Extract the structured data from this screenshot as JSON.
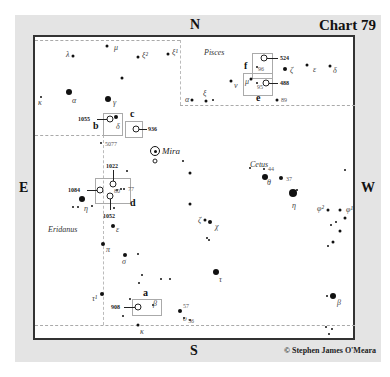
{
  "chart": {
    "title": "Chart 79",
    "credit": "© Stephen James O'Meara",
    "compass": {
      "north": "N",
      "south": "S",
      "east": "E",
      "west": "W"
    }
  },
  "constellations": [
    {
      "name": "Pisces",
      "x": 204,
      "y": 48
    },
    {
      "name": "Cetus",
      "x": 250,
      "y": 160
    },
    {
      "name": "Eridanus",
      "x": 48,
      "y": 225
    }
  ],
  "boxes": [
    {
      "id": "a",
      "label": "a",
      "box": {
        "x": 132,
        "y": 299,
        "w": 28,
        "h": 15
      },
      "label_pos": {
        "x": 143,
        "y": 287
      }
    },
    {
      "id": "b",
      "label": "b",
      "box": {
        "x": 103,
        "y": 113,
        "w": 18,
        "h": 21
      },
      "label_pos": {
        "x": 93,
        "y": 120
      }
    },
    {
      "id": "c",
      "label": "c",
      "box": {
        "x": 125,
        "y": 121,
        "w": 16,
        "h": 15
      },
      "label_pos": {
        "x": 130,
        "y": 108
      }
    },
    {
      "id": "d",
      "label": "d",
      "box": {
        "x": 95,
        "y": 178,
        "w": 34,
        "h": 24
      },
      "label_pos": {
        "x": 130,
        "y": 197
      }
    },
    {
      "id": "e",
      "label": "e",
      "box": {
        "x": 243,
        "y": 73,
        "w": 28,
        "h": 21
      },
      "label_pos": {
        "x": 256,
        "y": 92
      }
    },
    {
      "id": "f",
      "label": "f",
      "box": {
        "x": 252,
        "y": 53,
        "w": 19,
        "h": 24
      },
      "label_pos": {
        "x": 244,
        "y": 60
      }
    }
  ],
  "galaxies": [
    {
      "ngc": "908",
      "x": 138,
      "y": 307,
      "label_x": 111,
      "leader": {
        "x": 124,
        "w": 11
      }
    },
    {
      "ngc": "1055",
      "x": 110,
      "y": 119,
      "label_x": 78,
      "leader": {
        "x": 97,
        "w": 10
      }
    },
    {
      "ngc": "936",
      "x": 136,
      "y": 129,
      "label_x": 148,
      "leader": {
        "x": 139,
        "w": 8
      }
    },
    {
      "ngc": "1022",
      "x": 113,
      "y": 184,
      "label_x": 106,
      "label_y": 166,
      "vleader": {
        "y": 170,
        "h": 11
      }
    },
    {
      "ngc": "1084",
      "x": 100,
      "y": 190,
      "label_x": 68,
      "leader": {
        "x": 87,
        "w": 10
      }
    },
    {
      "ngc": "1052",
      "x": 110,
      "y": 196,
      "label_x": 103,
      "label_y": 216,
      "vleader": {
        "y": 199,
        "h": 11
      }
    },
    {
      "ngc": "524",
      "x": 264,
      "y": 58,
      "label_x": 280,
      "leader": {
        "x": 267,
        "w": 11
      }
    },
    {
      "ngc": "488",
      "x": 266,
      "y": 83,
      "label_x": 280,
      "leader": {
        "x": 269,
        "w": 9
      }
    }
  ],
  "mira": {
    "name": "Mira",
    "x": 155,
    "y": 151,
    "label_x": 162
  },
  "stars": [
    {
      "x": 73,
      "y": 56,
      "s": "s2",
      "lbl": "λ",
      "lx": 66,
      "ly": 54
    },
    {
      "x": 107,
      "y": 46,
      "s": "s2",
      "lbl": "μ",
      "lx": 114,
      "ly": 47
    },
    {
      "x": 138,
      "y": 57,
      "s": "s2",
      "lbl": "ξ²",
      "lx": 142,
      "ly": 55
    },
    {
      "x": 168,
      "y": 54,
      "s": "s2",
      "lbl": "ξ¹",
      "lx": 172,
      "ly": 52
    },
    {
      "x": 122,
      "y": 78,
      "s": "s2"
    },
    {
      "x": 69,
      "y": 92,
      "s": "s4",
      "lbl": "α",
      "lx": 72,
      "ly": 100
    },
    {
      "x": 108,
      "y": 99,
      "s": "s4",
      "lbl": "γ",
      "lx": 113,
      "ly": 102
    },
    {
      "x": 41,
      "y": 97,
      "s": "s1",
      "lbl": "κ",
      "lx": 38,
      "ly": 102
    },
    {
      "x": 116,
      "y": 117,
      "s": "s3",
      "lbl": "δ",
      "lx": 116,
      "ly": 126
    },
    {
      "x": 101,
      "y": 143,
      "s": "s1",
      "num": "5077",
      "nx": 105,
      "ny": 144
    },
    {
      "x": 183,
      "y": 161,
      "s": "s1"
    },
    {
      "x": 127,
      "y": 171,
      "s": "s1"
    },
    {
      "x": 121,
      "y": 189,
      "s": "s1"
    },
    {
      "x": 124,
      "y": 189,
      "s": "s1",
      "num": "77",
      "nx": 128,
      "ny": 189
    },
    {
      "x": 117,
      "y": 190,
      "s": "s1",
      "num": "80",
      "nx": 114,
      "ny": 191
    },
    {
      "x": 82,
      "y": 199,
      "s": "s4"
    },
    {
      "x": 73,
      "y": 207,
      "s": "s1"
    },
    {
      "x": 78,
      "y": 207,
      "s": "s1",
      "lbl": "η",
      "lx": 84,
      "ly": 208
    },
    {
      "x": 92,
      "y": 206,
      "s": "s1"
    },
    {
      "x": 114,
      "y": 208,
      "s": "s1"
    },
    {
      "x": 113,
      "y": 226,
      "s": "s3",
      "lbl": "ε",
      "lx": 116,
      "ly": 229
    },
    {
      "x": 103,
      "y": 244,
      "s": "s3",
      "lbl": "π",
      "lx": 106,
      "ly": 249
    },
    {
      "x": 125,
      "y": 255,
      "s": "s3",
      "lbl": "σ",
      "lx": 122,
      "ly": 261
    },
    {
      "x": 138,
      "y": 254,
      "s": "s1"
    },
    {
      "x": 142,
      "y": 275,
      "s": "s1"
    },
    {
      "x": 139,
      "y": 283,
      "s": "s1"
    },
    {
      "x": 161,
      "y": 279,
      "s": "s1"
    },
    {
      "x": 170,
      "y": 279,
      "s": "s1"
    },
    {
      "x": 102,
      "y": 294,
      "s": "s3",
      "lbl": "τ¹",
      "lx": 92,
      "ly": 298
    },
    {
      "x": 130,
      "y": 299,
      "s": "s1"
    },
    {
      "x": 153,
      "y": 305,
      "s": "s1",
      "lbl": "β",
      "lx": 153,
      "ly": 303
    },
    {
      "x": 123,
      "y": 316,
      "s": "s1"
    },
    {
      "x": 138,
      "y": 325,
      "s": "s2",
      "lbl": "κ",
      "lx": 140,
      "ly": 331
    },
    {
      "x": 180,
      "y": 311,
      "s": "s3",
      "num": "57",
      "nx": 183,
      "ny": 306
    },
    {
      "x": 184,
      "y": 318,
      "s": "s1",
      "lbl": "υ",
      "lx": 183,
      "ly": 318
    },
    {
      "x": 190,
      "y": 320,
      "s": "s1",
      "num": "56",
      "nx": 188,
      "ny": 321
    },
    {
      "x": 192,
      "y": 100,
      "s": "s2",
      "lbl": "α",
      "lx": 185,
      "ly": 99
    },
    {
      "x": 206,
      "y": 101,
      "s": "s2",
      "lbl": "ξ",
      "lx": 203,
      "ly": 93
    },
    {
      "x": 213,
      "y": 100,
      "s": "s1"
    },
    {
      "x": 231,
      "y": 81,
      "s": "s2",
      "lbl": "ν",
      "lx": 234,
      "ly": 85
    },
    {
      "x": 251,
      "y": 79,
      "s": "s2",
      "lbl": "μ",
      "lx": 245,
      "ly": 81
    },
    {
      "x": 257,
      "y": 83,
      "s": "s1",
      "num": "95",
      "nx": 257,
      "ny": 87
    },
    {
      "x": 257,
      "y": 67,
      "s": "s1",
      "num": "96",
      "nx": 258,
      "ny": 69
    },
    {
      "x": 285,
      "y": 69,
      "s": "s3",
      "lbl": "ζ",
      "lx": 290,
      "ly": 70
    },
    {
      "x": 307,
      "y": 65,
      "s": "s2",
      "lbl": "ε",
      "lx": 313,
      "ly": 69
    },
    {
      "x": 330,
      "y": 66,
      "s": "s2",
      "lbl": "δ",
      "lx": 333,
      "ly": 70
    },
    {
      "x": 277,
      "y": 100,
      "s": "s2",
      "num": "89",
      "nx": 281,
      "ny": 100
    },
    {
      "x": 190,
      "y": 204,
      "s": "s2"
    },
    {
      "x": 190,
      "y": 173,
      "s": "s2"
    },
    {
      "x": 205,
      "y": 220,
      "s": "s2",
      "lbl": "ζ",
      "lx": 198,
      "ly": 220
    },
    {
      "x": 210,
      "y": 222,
      "s": "s3",
      "lbl": "χ",
      "lx": 215,
      "ly": 226
    },
    {
      "x": 207,
      "y": 238,
      "s": "s1"
    },
    {
      "x": 209,
      "y": 240,
      "s": "s1"
    },
    {
      "x": 250,
      "y": 168,
      "s": "s1"
    },
    {
      "x": 264,
      "y": 169,
      "s": "s1",
      "num": "44",
      "nx": 268,
      "ny": 169
    },
    {
      "x": 265,
      "y": 177,
      "s": "s4",
      "lbl": "θ",
      "lx": 267,
      "ly": 182
    },
    {
      "x": 281,
      "y": 178,
      "s": "s3",
      "num": "37",
      "nx": 286,
      "ny": 179
    },
    {
      "x": 293,
      "y": 193,
      "s": "s5",
      "lbl": "η",
      "lx": 292,
      "ly": 205
    },
    {
      "x": 297,
      "y": 190,
      "s": "s1"
    },
    {
      "x": 328,
      "y": 210,
      "s": "s2",
      "lbl": "φ²",
      "lx": 317,
      "ly": 208
    },
    {
      "x": 340,
      "y": 231,
      "s": "s2",
      "lbl": "φ¹",
      "lx": 346,
      "ly": 209
    },
    {
      "x": 340,
      "y": 210,
      "s": "s2"
    },
    {
      "x": 345,
      "y": 218,
      "s": "s2"
    },
    {
      "x": 336,
      "y": 222,
      "s": "s1"
    },
    {
      "x": 331,
      "y": 225,
      "s": "s1"
    },
    {
      "x": 345,
      "y": 170,
      "s": "s1"
    },
    {
      "x": 216,
      "y": 272,
      "s": "s4",
      "lbl": "τ",
      "lx": 219,
      "ly": 279
    },
    {
      "x": 333,
      "y": 242,
      "s": "s2"
    },
    {
      "x": 328,
      "y": 246,
      "s": "s1"
    },
    {
      "x": 333,
      "y": 296,
      "s": "s4",
      "lbl": "β",
      "lx": 337,
      "ly": 302
    },
    {
      "x": 327,
      "y": 296,
      "s": "s1"
    },
    {
      "x": 326,
      "y": 327,
      "s": "s1"
    },
    {
      "x": 332,
      "y": 329,
      "s": "s1"
    },
    {
      "x": 329,
      "y": 334,
      "s": "s1"
    }
  ],
  "borders": {
    "h1": {
      "x": 35,
      "y": 40,
      "w": 145
    },
    "h2": {
      "x": 180,
      "y": 105,
      "w": 175
    },
    "h3": {
      "x": 35,
      "y": 135,
      "w": 70
    },
    "h4": {
      "x": 35,
      "y": 325,
      "w": 320
    },
    "v1": {
      "x": 180,
      "y": 40,
      "h": 65
    },
    "v2": {
      "x": 103,
      "y": 135,
      "h": 190
    }
  }
}
